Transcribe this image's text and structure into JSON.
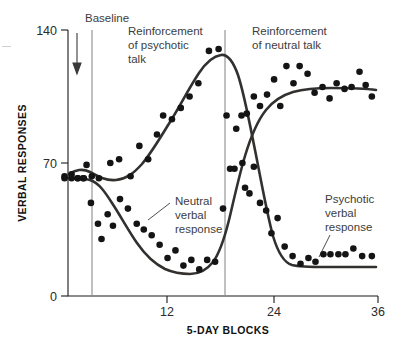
{
  "figure": {
    "axis_titles": {
      "y": "VERBAL RESPONSES",
      "x": "5-DAY BLOCKS"
    },
    "y_ticks": [
      "0",
      "70",
      "140"
    ],
    "x_ticks": [
      "12",
      "24",
      "36"
    ],
    "phase_labels": {
      "baseline": "Baseline",
      "phase2_line1": "Reinforcement",
      "phase2_line2": "of psychotic",
      "phase2_line3": "talk",
      "phase3_line1": "Reinforcement",
      "phase3_line2": "of neutral talk"
    },
    "series_labels": {
      "neutral_line1": "Neutral",
      "neutral_line2": "verbal",
      "neutral_line3": "response",
      "psychotic_line1": "Psychotic",
      "psychotic_line2": "verbal",
      "psychotic_line3": "response"
    },
    "colors": {
      "curve": "#33312f",
      "point": "#141414",
      "axis": "#1a1a1a",
      "divider": "#8c8c8c",
      "annotation_text": "#3d3d3d"
    }
  },
  "chart_data": {
    "type": "scatter",
    "title": "",
    "xlabel": "5-DAY BLOCKS",
    "ylabel": "VERBAL RESPONSES",
    "xlim": [
      0,
      36
    ],
    "ylim": [
      0,
      140
    ],
    "xticks": [
      12,
      24,
      36
    ],
    "yticks": [
      0,
      70,
      140
    ],
    "grid": false,
    "legend": "inline-annotations",
    "phase_dividers": [
      3.0,
      19.5
    ],
    "phases": [
      {
        "name": "Baseline",
        "x_start": 0.0,
        "x_end": 3.0
      },
      {
        "name": "Reinforcement of psychotic talk",
        "x_start": 3.0,
        "x_end": 19.5
      },
      {
        "name": "Reinforcement of neutral talk",
        "x_start": 19.5,
        "x_end": 36.0
      }
    ],
    "series": [
      {
        "name": "Psychotic verbal response",
        "points": [
          [
            0.4,
            63
          ],
          [
            1.2,
            64
          ],
          [
            1.9,
            62
          ],
          [
            2.5,
            62
          ],
          [
            2.9,
            69
          ],
          [
            3.5,
            63
          ],
          [
            4.3,
            62
          ],
          [
            5.6,
            70
          ],
          [
            6.6,
            72
          ],
          [
            7.9,
            63
          ],
          [
            8.9,
            79
          ],
          [
            9.9,
            72
          ],
          [
            10.9,
            85
          ],
          [
            11.6,
            95
          ],
          [
            12.6,
            93
          ],
          [
            13.6,
            99
          ],
          [
            14.6,
            105
          ],
          [
            15.6,
            112
          ],
          [
            16.8,
            129
          ],
          [
            17.9,
            130
          ],
          [
            18.8,
            95
          ],
          [
            19.7,
            67
          ],
          [
            20.6,
            70
          ],
          [
            20.9,
            57
          ],
          [
            21.4,
            54
          ],
          [
            21.9,
            68
          ],
          [
            22.6,
            49
          ],
          [
            23.3,
            45
          ],
          [
            23.9,
            33
          ],
          [
            24.6,
            41
          ],
          [
            25.4,
            26
          ],
          [
            26.3,
            21
          ],
          [
            27.2,
            17
          ],
          [
            28.1,
            20
          ],
          [
            28.9,
            18
          ],
          [
            29.8,
            22
          ],
          [
            30.6,
            22
          ],
          [
            31.5,
            22
          ],
          [
            32.3,
            22
          ],
          [
            33.2,
            25
          ],
          [
            34.2,
            21
          ],
          [
            35.3,
            21
          ]
        ]
      },
      {
        "name": "Neutral verbal response",
        "points": [
          [
            0.4,
            62
          ],
          [
            1.2,
            62
          ],
          [
            1.9,
            62
          ],
          [
            2.6,
            62
          ],
          [
            3.4,
            49
          ],
          [
            4.2,
            38
          ],
          [
            4.6,
            30
          ],
          [
            5.3,
            43
          ],
          [
            5.9,
            37
          ],
          [
            6.7,
            51
          ],
          [
            7.6,
            46
          ],
          [
            8.6,
            38
          ],
          [
            9.4,
            35
          ],
          [
            10.3,
            32
          ],
          [
            11.2,
            27
          ],
          [
            12.1,
            20
          ],
          [
            13.0,
            24
          ],
          [
            13.9,
            16
          ],
          [
            14.8,
            19
          ],
          [
            15.7,
            14
          ],
          [
            16.6,
            19
          ],
          [
            17.5,
            18
          ],
          [
            18.4,
            46
          ],
          [
            19.2,
            67
          ],
          [
            19.9,
            88
          ],
          [
            20.5,
            95
          ],
          [
            21.1,
            96
          ],
          [
            21.9,
            105
          ],
          [
            22.6,
            100
          ],
          [
            23.4,
            106
          ],
          [
            24.2,
            114
          ],
          [
            24.9,
            100
          ],
          [
            25.6,
            121
          ],
          [
            26.4,
            112
          ],
          [
            27.1,
            121
          ],
          [
            28.0,
            117
          ],
          [
            28.8,
            107
          ],
          [
            29.7,
            110
          ],
          [
            30.5,
            104
          ],
          [
            31.3,
            112
          ],
          [
            32.2,
            109
          ],
          [
            33.0,
            110
          ],
          [
            33.9,
            118
          ],
          [
            34.6,
            111
          ],
          [
            35.3,
            105
          ]
        ]
      }
    ],
    "fitted_curves": [
      {
        "name": "Psychotic verbal response (fit)",
        "description": "Starts ~64, dips slightly, rises to peak ~130 at block 18, falls steeply to ~20 plateau after block 26"
      },
      {
        "name": "Neutral verbal response (fit)",
        "description": "Starts ~62, declines to ~16 minimum around block 15, rises steeply after block 19 to ~110 plateau"
      }
    ]
  }
}
